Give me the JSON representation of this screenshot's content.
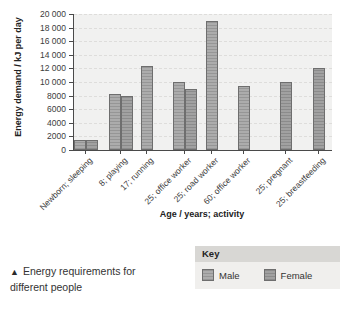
{
  "chart_data": {
    "type": "bar",
    "title": "",
    "categories": [
      "Newborn; sleeping",
      "8; playing",
      "17; running",
      "25; office worker",
      "25; road worker",
      "60; office worker",
      "25; pregnant",
      "25; breastfeeding"
    ],
    "series": [
      {
        "name": "Male",
        "color": "#a7a7a7",
        "values": [
          1500,
          8200,
          12400,
          10000,
          18900,
          9400,
          null,
          null
        ]
      },
      {
        "name": "Female",
        "color": "#9b9b9b",
        "values": [
          1500,
          8000,
          null,
          8900,
          null,
          null,
          10000,
          12100
        ]
      }
    ],
    "xlabel": "Age / years; activity",
    "ylabel": "Energy demand / kJ per day",
    "ylim": [
      0,
      20000
    ],
    "ytick_step": 2000,
    "ytick_labels": [
      "0",
      "2000",
      "4000",
      "6000",
      "8000",
      "10 000",
      "12 000",
      "14 000",
      "16 000",
      "18 000",
      "20 000"
    ],
    "grid": "horizontal-dashed",
    "legend_position": "bottom-right-box"
  },
  "key": {
    "title": "Key",
    "items": [
      {
        "label": "Male"
      },
      {
        "label": "Female"
      }
    ]
  },
  "caption": {
    "marker": "▲",
    "text": "Energy requirements for different people"
  }
}
